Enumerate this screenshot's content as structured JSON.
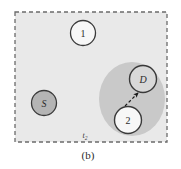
{
  "figure": {
    "caption": "(b)",
    "time_label": "t",
    "time_label_subscript": "2"
  },
  "colors": {
    "page_background": "#ffffff",
    "region_fill": "#e9e9e9",
    "region_border": "#6b6b6b",
    "cluster_fill": "#c9c9c9",
    "node_white_fill": "#f7f7f7",
    "node_gray_fill": "#b4b4b4",
    "node_lightgray_fill": "#d8d8d8",
    "node_stroke": "#3a3a3a",
    "arrow_color": "#1a1a1a",
    "text_color": "#2b2b2b"
  },
  "region": {
    "name": "monitored-area",
    "x": 15,
    "y": 12,
    "width": 152,
    "height": 130,
    "dash": "4 3"
  },
  "cluster": {
    "name": "dense-region",
    "cx": 132,
    "cy": 99,
    "rx": 33,
    "ry": 37
  },
  "nodes": [
    {
      "id": "node-1",
      "label": "1",
      "style": "white",
      "italic": false,
      "cx": 83,
      "cy": 33,
      "r": 12.5
    },
    {
      "id": "node-s",
      "label": "S",
      "style": "gray",
      "italic": true,
      "cx": 44,
      "cy": 103,
      "r": 12.5
    },
    {
      "id": "node-d",
      "label": "D",
      "style": "lightgray",
      "italic": true,
      "cx": 143,
      "cy": 79,
      "r": 13.5
    },
    {
      "id": "node-2",
      "label": "2",
      "style": "white",
      "italic": false,
      "cx": 128,
      "cy": 120,
      "r": 13.5
    }
  ],
  "arrow": {
    "name": "transmission-arrow",
    "from_node": "node-2",
    "to_node": "node-d",
    "x1": 125,
    "y1": 106,
    "x2": 138,
    "y2": 93,
    "dash": "3 2.2"
  }
}
